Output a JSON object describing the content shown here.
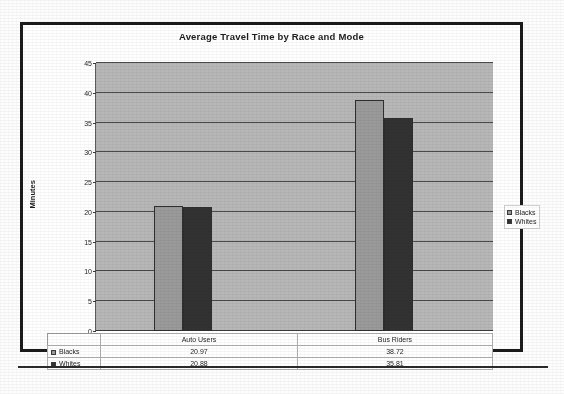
{
  "chart_data": {
    "type": "bar",
    "title": "Average Travel Time by Race and Mode",
    "xlabel": "",
    "ylabel": "Minutes",
    "ylim": [
      0,
      45
    ],
    "ytick_step": 5,
    "yticks": [
      45,
      40,
      35,
      30,
      25,
      20,
      15,
      10,
      5,
      0
    ],
    "grid": true,
    "legend_position": "right",
    "categories": [
      "Auto Users",
      "Bus Riders"
    ],
    "series": [
      {
        "name": "Blacks",
        "color": "#9a9a9a",
        "values": [
          20.97,
          38.72
        ]
      },
      {
        "name": "Whites",
        "color": "#323232",
        "values": [
          20.88,
          35.81
        ]
      }
    ],
    "data_table": {
      "row_labels": [
        "Blacks",
        "Whites"
      ],
      "column_headers": [
        "Auto Users",
        "Bus Riders"
      ],
      "cells": [
        [
          "20.97",
          "38.72"
        ],
        [
          "20.88",
          "35.81"
        ]
      ]
    }
  },
  "legend": {
    "items": [
      {
        "label": "Blacks"
      },
      {
        "label": "Whites"
      }
    ]
  }
}
